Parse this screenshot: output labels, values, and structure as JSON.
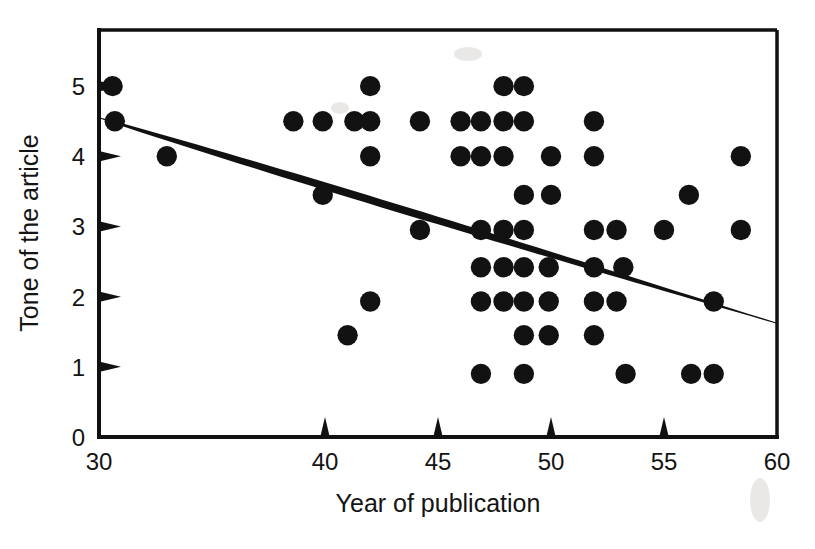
{
  "chart_data": {
    "type": "scatter",
    "title": "",
    "xlabel": "Year of publication",
    "ylabel": "Tone of the article",
    "xlim": [
      30,
      60
    ],
    "ylim": [
      0,
      5.8
    ],
    "grid": false,
    "legend": "none",
    "xticks": [
      30,
      40,
      45,
      50,
      55,
      60
    ],
    "xtick_labels": [
      "30",
      "40",
      "45",
      "50",
      "55",
      "60"
    ],
    "yticks": [
      0,
      1,
      2,
      3,
      4,
      5
    ],
    "ytick_labels": [
      "0",
      "1",
      "2",
      "3",
      "4",
      "5"
    ],
    "marker": "filled-circle",
    "marker_color": "#121212",
    "points": [
      {
        "x": 30.6,
        "y": 5.0
      },
      {
        "x": 30.7,
        "y": 4.5
      },
      {
        "x": 33.0,
        "y": 4.0
      },
      {
        "x": 38.6,
        "y": 4.5
      },
      {
        "x": 39.9,
        "y": 4.5
      },
      {
        "x": 39.9,
        "y": 3.45
      },
      {
        "x": 41.0,
        "y": 1.45
      },
      {
        "x": 41.3,
        "y": 4.5
      },
      {
        "x": 42.0,
        "y": 5.0
      },
      {
        "x": 42.0,
        "y": 4.5
      },
      {
        "x": 42.0,
        "y": 4.0
      },
      {
        "x": 42.0,
        "y": 1.93
      },
      {
        "x": 44.2,
        "y": 4.5
      },
      {
        "x": 44.2,
        "y": 2.95
      },
      {
        "x": 46.0,
        "y": 4.5
      },
      {
        "x": 46.0,
        "y": 4.0
      },
      {
        "x": 46.9,
        "y": 4.5
      },
      {
        "x": 46.9,
        "y": 4.0
      },
      {
        "x": 46.9,
        "y": 2.95
      },
      {
        "x": 46.9,
        "y": 2.42
      },
      {
        "x": 46.9,
        "y": 1.93
      },
      {
        "x": 46.9,
        "y": 0.9
      },
      {
        "x": 47.9,
        "y": 5.0
      },
      {
        "x": 47.9,
        "y": 4.5
      },
      {
        "x": 47.9,
        "y": 4.0
      },
      {
        "x": 47.9,
        "y": 2.95
      },
      {
        "x": 47.9,
        "y": 2.42
      },
      {
        "x": 47.9,
        "y": 1.93
      },
      {
        "x": 48.8,
        "y": 5.0
      },
      {
        "x": 48.8,
        "y": 4.5
      },
      {
        "x": 48.8,
        "y": 3.45
      },
      {
        "x": 48.8,
        "y": 2.95
      },
      {
        "x": 48.8,
        "y": 2.42
      },
      {
        "x": 48.8,
        "y": 1.93
      },
      {
        "x": 48.8,
        "y": 1.45
      },
      {
        "x": 48.8,
        "y": 0.9
      },
      {
        "x": 49.9,
        "y": 2.42
      },
      {
        "x": 49.9,
        "y": 1.93
      },
      {
        "x": 49.9,
        "y": 1.45
      },
      {
        "x": 50.0,
        "y": 4.0
      },
      {
        "x": 50.0,
        "y": 3.45
      },
      {
        "x": 51.9,
        "y": 4.5
      },
      {
        "x": 51.9,
        "y": 4.0
      },
      {
        "x": 51.9,
        "y": 2.95
      },
      {
        "x": 51.9,
        "y": 2.42
      },
      {
        "x": 51.9,
        "y": 1.93
      },
      {
        "x": 51.9,
        "y": 1.45
      },
      {
        "x": 52.9,
        "y": 2.95
      },
      {
        "x": 52.9,
        "y": 1.93
      },
      {
        "x": 53.2,
        "y": 2.42
      },
      {
        "x": 53.3,
        "y": 0.9
      },
      {
        "x": 55.0,
        "y": 2.95
      },
      {
        "x": 56.1,
        "y": 3.45
      },
      {
        "x": 56.2,
        "y": 0.9
      },
      {
        "x": 57.2,
        "y": 1.93
      },
      {
        "x": 57.2,
        "y": 0.9
      },
      {
        "x": 58.4,
        "y": 4.0
      },
      {
        "x": 58.4,
        "y": 2.95
      }
    ],
    "fit_line": {
      "type": "linear-regression",
      "x_start": 30,
      "y_start": 4.55,
      "x_end": 60,
      "y_end": 1.62,
      "color": "#111111",
      "style": "solid-tapered"
    }
  }
}
